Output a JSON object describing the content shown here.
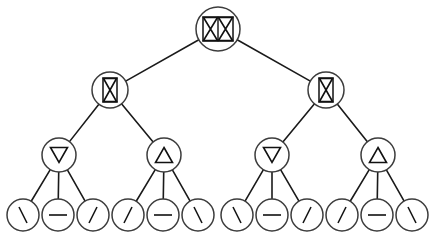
{
  "diagram": {
    "type": "tree",
    "width": 434,
    "height": 239,
    "background_color": "#ffffff",
    "node_stroke_color": "#3c3c3c",
    "edge_stroke_color": "#1a1a1a",
    "glyph_color": "#111111",
    "levels": 4,
    "node_count": 19,
    "leaf_count": 12
  },
  "nodes": [
    {
      "id": "n-root",
      "name": "root",
      "level": 0,
      "glyph": "double-hourglass-in-rectangle",
      "glyph_label": "XX",
      "cx": 218,
      "cy": 29,
      "r": 22
    },
    {
      "id": "n-l2-left",
      "name": "level2-left",
      "level": 1,
      "glyph": "hourglass-in-rectangle",
      "glyph_label": "X",
      "cx": 110,
      "cy": 90,
      "r": 18
    },
    {
      "id": "n-l2-right",
      "name": "level2-right",
      "level": 1,
      "glyph": "hourglass-in-rectangle",
      "glyph_label": "X",
      "cx": 326,
      "cy": 90,
      "r": 18
    },
    {
      "id": "n-l3-1",
      "name": "level3-1",
      "level": 2,
      "glyph": "triangle-down",
      "glyph_label": "∇",
      "cx": 59,
      "cy": 155,
      "r": 17
    },
    {
      "id": "n-l3-2",
      "name": "level3-2",
      "level": 2,
      "glyph": "triangle-up",
      "glyph_label": "Δ",
      "cx": 164,
      "cy": 155,
      "r": 17
    },
    {
      "id": "n-l3-3",
      "name": "level3-3",
      "level": 2,
      "glyph": "triangle-down",
      "glyph_label": "∇",
      "cx": 272,
      "cy": 155,
      "r": 17
    },
    {
      "id": "n-l3-4",
      "name": "level3-4",
      "level": 2,
      "glyph": "triangle-up",
      "glyph_label": "Δ",
      "cx": 378,
      "cy": 155,
      "r": 17
    },
    {
      "id": "n-leaf-1",
      "name": "leaf-1",
      "level": 3,
      "glyph": "backslash",
      "glyph_label": "\\",
      "cx": 23,
      "cy": 215,
      "r": 16
    },
    {
      "id": "n-leaf-2",
      "name": "leaf-2",
      "level": 3,
      "glyph": "minus",
      "glyph_label": "−",
      "cx": 58,
      "cy": 215,
      "r": 16
    },
    {
      "id": "n-leaf-3",
      "name": "leaf-3",
      "level": 3,
      "glyph": "slash",
      "glyph_label": "/",
      "cx": 93,
      "cy": 215,
      "r": 16
    },
    {
      "id": "n-leaf-4",
      "name": "leaf-4",
      "level": 3,
      "glyph": "slash",
      "glyph_label": "/",
      "cx": 128,
      "cy": 215,
      "r": 16
    },
    {
      "id": "n-leaf-5",
      "name": "leaf-5",
      "level": 3,
      "glyph": "minus",
      "glyph_label": "−",
      "cx": 163,
      "cy": 215,
      "r": 16
    },
    {
      "id": "n-leaf-6",
      "name": "leaf-6",
      "level": 3,
      "glyph": "backslash",
      "glyph_label": "\\",
      "cx": 198,
      "cy": 215,
      "r": 16
    },
    {
      "id": "n-leaf-7",
      "name": "leaf-7",
      "level": 3,
      "glyph": "backslash",
      "glyph_label": "\\",
      "cx": 237,
      "cy": 215,
      "r": 16
    },
    {
      "id": "n-leaf-8",
      "name": "leaf-8",
      "level": 3,
      "glyph": "minus",
      "glyph_label": "−",
      "cx": 272,
      "cy": 215,
      "r": 16
    },
    {
      "id": "n-leaf-9",
      "name": "leaf-9",
      "level": 3,
      "glyph": "slash",
      "glyph_label": "/",
      "cx": 307,
      "cy": 215,
      "r": 16
    },
    {
      "id": "n-leaf-10",
      "name": "leaf-10",
      "level": 3,
      "glyph": "slash",
      "glyph_label": "/",
      "cx": 342,
      "cy": 215,
      "r": 16
    },
    {
      "id": "n-leaf-11",
      "name": "leaf-11",
      "level": 3,
      "glyph": "minus",
      "glyph_label": "−",
      "cx": 377,
      "cy": 215,
      "r": 16
    },
    {
      "id": "n-leaf-12",
      "name": "leaf-12",
      "level": 3,
      "glyph": "backslash",
      "glyph_label": "\\",
      "cx": 412,
      "cy": 215,
      "r": 16
    }
  ],
  "edges": [
    {
      "from": "n-root",
      "to": "n-l2-left"
    },
    {
      "from": "n-root",
      "to": "n-l2-right"
    },
    {
      "from": "n-l2-left",
      "to": "n-l3-1"
    },
    {
      "from": "n-l2-left",
      "to": "n-l3-2"
    },
    {
      "from": "n-l2-right",
      "to": "n-l3-3"
    },
    {
      "from": "n-l2-right",
      "to": "n-l3-4"
    },
    {
      "from": "n-l3-1",
      "to": "n-leaf-1"
    },
    {
      "from": "n-l3-1",
      "to": "n-leaf-2"
    },
    {
      "from": "n-l3-1",
      "to": "n-leaf-3"
    },
    {
      "from": "n-l3-2",
      "to": "n-leaf-4"
    },
    {
      "from": "n-l3-2",
      "to": "n-leaf-5"
    },
    {
      "from": "n-l3-2",
      "to": "n-leaf-6"
    },
    {
      "from": "n-l3-3",
      "to": "n-leaf-7"
    },
    {
      "from": "n-l3-3",
      "to": "n-leaf-8"
    },
    {
      "from": "n-l3-3",
      "to": "n-leaf-9"
    },
    {
      "from": "n-l3-4",
      "to": "n-leaf-10"
    },
    {
      "from": "n-l3-4",
      "to": "n-leaf-11"
    },
    {
      "from": "n-l3-4",
      "to": "n-leaf-12"
    }
  ]
}
